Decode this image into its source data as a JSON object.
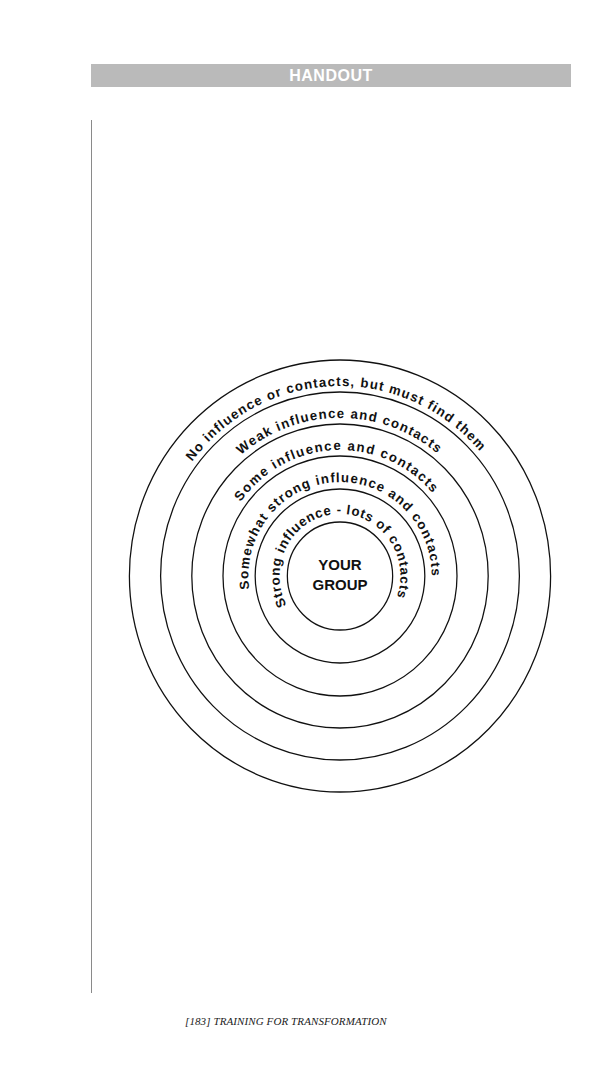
{
  "header": {
    "title": "HANDOUT"
  },
  "diagram": {
    "center_label_line1": "YOUR",
    "center_label_line2": "GROUP",
    "rings": [
      {
        "label": "No influence or contacts, but must find them"
      },
      {
        "label": "Weak influence and contacts"
      },
      {
        "label": "Some influence and contacts"
      },
      {
        "label": "Somewhat strong influence and contacts"
      },
      {
        "label": "Strong influence - lots of contacts"
      }
    ]
  },
  "footer": {
    "text": "[183]  TRAINING FOR TRANSFORMATION"
  },
  "colors": {
    "banner": "#bababa",
    "banner_text": "#ffffff",
    "lines": "#111111"
  }
}
